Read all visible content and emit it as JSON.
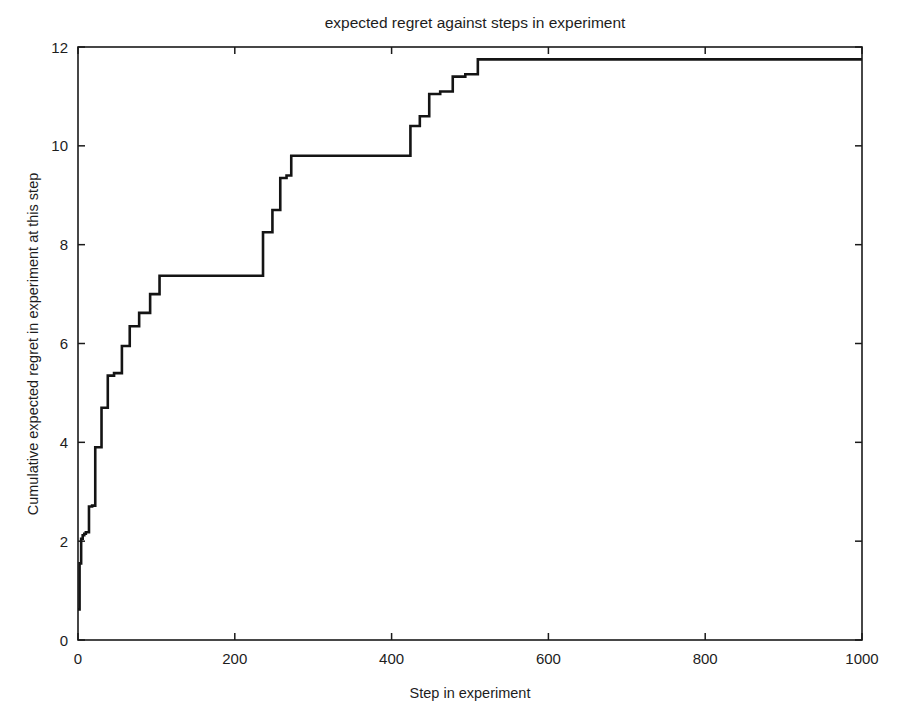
{
  "figure": {
    "width": 899,
    "height": 728,
    "background": "#ffffff",
    "line_color": "#141414",
    "axis_color": "#1a1a1a",
    "text_color": "#1d1d1d"
  },
  "chart_data": {
    "type": "line",
    "style": "step-post",
    "title": "expected regret against steps in experiment",
    "xlabel": "Step in experiment",
    "ylabel": "Cumulative expected regret in experiment at this step",
    "xlim": [
      0,
      1000
    ],
    "ylim": [
      0,
      12
    ],
    "xticks": [
      0,
      200,
      400,
      600,
      800,
      1000
    ],
    "yticks": [
      0,
      2,
      4,
      6,
      8,
      10,
      12
    ],
    "xtick_labels": [
      "0",
      "200",
      "400",
      "600",
      "800",
      "1000"
    ],
    "ytick_labels": [
      "0",
      "2",
      "4",
      "6",
      "8",
      "10",
      "12"
    ],
    "grid": false,
    "legend": null,
    "series": [
      {
        "name": "cumulative expected regret",
        "color": "#141414",
        "x": [
          0,
          2,
          4,
          6,
          8,
          10,
          14,
          18,
          22,
          30,
          38,
          46,
          56,
          66,
          78,
          92,
          104,
          116,
          222,
          236,
          248,
          258,
          266,
          272,
          414,
          424,
          436,
          448,
          462,
          478,
          494,
          510,
          1000
        ],
        "y": [
          0.62,
          1.55,
          2.05,
          2.12,
          2.15,
          2.18,
          2.7,
          2.72,
          3.9,
          4.7,
          5.35,
          5.4,
          5.95,
          6.35,
          6.62,
          7.0,
          7.37,
          7.37,
          7.37,
          8.25,
          8.7,
          9.35,
          9.4,
          9.8,
          9.8,
          10.4,
          10.6,
          11.05,
          11.1,
          11.4,
          11.45,
          11.75,
          11.75
        ]
      }
    ]
  },
  "axes_geometry": {
    "left": 78,
    "right": 862,
    "top": 47,
    "bottom": 640,
    "tick_length": 7
  },
  "annotations": {
    "title_x": 475,
    "title_y": 28,
    "xlabel_x": 470,
    "xlabel_y": 698,
    "ylabel_x": 38,
    "ylabel_y": 344
  }
}
